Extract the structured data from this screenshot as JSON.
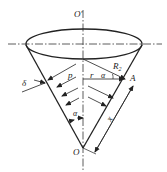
{
  "diagram": {
    "type": "conical shell under internal pressure",
    "colors": {
      "stroke": "#222222",
      "background": "#ffffff"
    },
    "labels": {
      "top_axis_point": "O′",
      "apex": "O",
      "radius_R2": "R",
      "radius_R2_sub": "2",
      "point_A": "A",
      "radius_r": "r",
      "angle_alpha_top": "α",
      "pressure": "p",
      "thickness": "δ",
      "half_angle": "α",
      "slant_length": "x"
    }
  }
}
